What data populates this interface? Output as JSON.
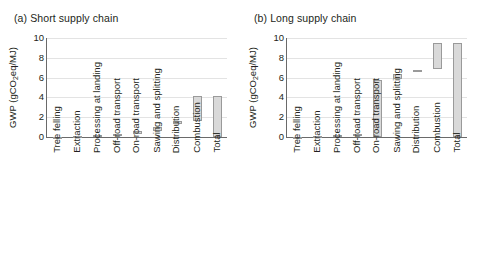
{
  "figure": {
    "width": 479,
    "height": 258,
    "background": "#ffffff"
  },
  "style": {
    "bar_fill": "#d9d9d9",
    "bar_stroke": "#9a9a9a",
    "grid_color": "#e3e3e3",
    "axis_color": "#6a6a6a",
    "text_color": "#231f20"
  },
  "panels": [
    {
      "id": "a",
      "title": "(a) Short supply chain"
    },
    {
      "id": "b",
      "title": "(b) Long supply chain"
    }
  ],
  "axis": {
    "ylabel_prefix": "GWP (gCO",
    "ylabel_sub": "2",
    "ylabel_suffix": "eq/MJ)",
    "yticks": [
      "10",
      "8",
      "6",
      "4",
      "2",
      "0"
    ],
    "ymin": 0,
    "ymax": 10
  },
  "categories": [
    "Tree felling",
    "Extraction",
    "Processing at landing",
    "Off-road transport",
    "On-road transport",
    "Sawing and splitting",
    "Distribution",
    "Combustion",
    "Total"
  ],
  "chart_data": [
    {
      "type": "bar",
      "title": "(a) Short supply chain",
      "xlabel": "",
      "ylabel": "GWP (gCO2eq/MJ)",
      "ylim": [
        0,
        10
      ],
      "yticks": [
        0,
        2,
        4,
        6,
        8,
        10
      ],
      "grid": true,
      "legend": "none",
      "waterfall": true,
      "categories": [
        "Tree felling",
        "Extraction",
        "Processing at landing",
        "Off-road transport",
        "On-road transport",
        "Sawing and splitting",
        "Distribution",
        "Combustion",
        "Total"
      ],
      "bars": [
        {
          "category": "Tree felling",
          "base": 0.0,
          "top": 0.05,
          "value": 0.05
        },
        {
          "category": "Extraction",
          "base": 0.05,
          "top": 0.12,
          "value": 0.07
        },
        {
          "category": "Processing at landing",
          "base": 0.12,
          "top": 0.2,
          "value": 0.08
        },
        {
          "category": "Off-road transport",
          "base": 0.2,
          "top": 0.33,
          "value": 0.13
        },
        {
          "category": "On-road transport",
          "base": 0.33,
          "top": 0.6,
          "value": 0.27
        },
        {
          "category": "Sawing and splitting",
          "base": 0.6,
          "top": 1.05,
          "value": 0.45
        },
        {
          "category": "Distribution",
          "base": 1.3,
          "top": 1.6,
          "value": 0.3
        },
        {
          "category": "Combustion",
          "base": 1.62,
          "top": 4.18,
          "value": 2.56
        },
        {
          "category": "Total",
          "base": 0.0,
          "top": 4.18,
          "value": 4.18
        }
      ]
    },
    {
      "type": "bar",
      "title": "(b) Long supply chain",
      "xlabel": "",
      "ylabel": "GWP (gCO2eq/MJ)",
      "ylim": [
        0,
        10
      ],
      "yticks": [
        0,
        2,
        4,
        6,
        8,
        10
      ],
      "grid": true,
      "legend": "none",
      "waterfall": true,
      "categories": [
        "Tree felling",
        "Extraction",
        "Processing at landing",
        "Off-road transport",
        "On-road transport",
        "Sawing and splitting",
        "Distribution",
        "Combustion",
        "Total"
      ],
      "bars": [
        {
          "category": "Tree felling",
          "base": 0.0,
          "top": 0.05,
          "value": 0.05
        },
        {
          "category": "Extraction",
          "base": 0.05,
          "top": 0.12,
          "value": 0.07
        },
        {
          "category": "Processing at landing",
          "base": 0.12,
          "top": 0.2,
          "value": 0.08
        },
        {
          "category": "Off-road transport",
          "base": 0.2,
          "top": 0.33,
          "value": 0.13
        },
        {
          "category": "On-road transport",
          "base": 0.0,
          "top": 5.8,
          "value": 5.8
        },
        {
          "category": "Sawing and splitting",
          "base": 5.9,
          "top": 6.35,
          "value": 0.45
        },
        {
          "category": "Distribution",
          "base": 6.55,
          "top": 6.8,
          "value": 0.25
        },
        {
          "category": "Combustion",
          "base": 6.9,
          "top": 9.5,
          "value": 2.6
        },
        {
          "category": "Total",
          "base": 0.0,
          "top": 9.5,
          "value": 9.5
        }
      ]
    }
  ]
}
